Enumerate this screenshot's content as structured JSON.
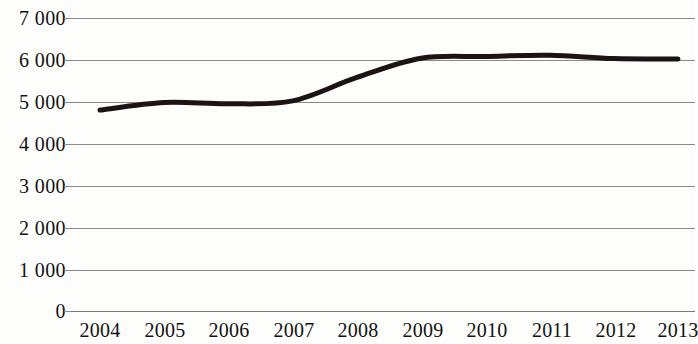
{
  "chart_data": {
    "type": "line",
    "title": "",
    "subtitle": "",
    "xlabel": "",
    "ylabel": "",
    "x": [
      "2004",
      "2005",
      "2006",
      "2007",
      "2008",
      "2009",
      "2010",
      "2011",
      "2012",
      "2013"
    ],
    "categories": [
      "2004",
      "2005",
      "2006",
      "2007",
      "2008",
      "2009",
      "2010",
      "2011",
      "2012",
      "2013"
    ],
    "values": [
      4800,
      4980,
      4950,
      5020,
      5580,
      6040,
      6080,
      6110,
      6030,
      6020
    ],
    "series": [
      {
        "name": "",
        "values": [
          4800,
          4980,
          4950,
          5020,
          5580,
          6040,
          6080,
          6110,
          6030,
          6020
        ]
      }
    ],
    "ylim": [
      0,
      7000
    ],
    "xlim": [
      "2004",
      "2013"
    ],
    "y_ticks": [
      0,
      1000,
      2000,
      3000,
      4000,
      5000,
      6000,
      7000
    ],
    "y_tick_labels": [
      "0",
      "1 000",
      "2 000",
      "3 000",
      "4 000",
      "5 000",
      "6 000",
      "7 000"
    ],
    "x_tick_labels": [
      "2004",
      "2005",
      "2006",
      "2007",
      "2008",
      "2009",
      "2010",
      "2011",
      "2012",
      "2013"
    ],
    "grid": true,
    "grid_axis": "y",
    "legend": false,
    "legend_position": "none",
    "line_color": "#1a1512",
    "grid_color": "#8a8a8a",
    "background_color": "#fdfdfc",
    "text_color": "#121212",
    "line_width": 5,
    "markers": false,
    "annotations": []
  }
}
